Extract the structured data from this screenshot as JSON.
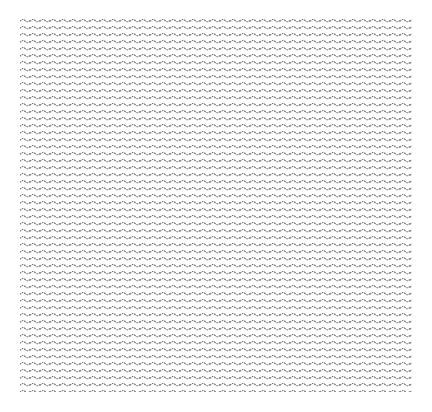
{
  "canvas": {
    "width": 432,
    "height": 412,
    "background": "#ffffff"
  },
  "texture": {
    "name": "wavy-line-pattern",
    "region": {
      "x": 20,
      "y": 17,
      "width": 392,
      "height": 375
    },
    "wave_period_px": 10,
    "row_spacing_px": 7,
    "stroke_color": "#6e6e6e",
    "stroke_width": 1.1
  }
}
